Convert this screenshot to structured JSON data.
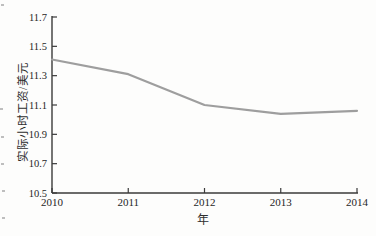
{
  "figure": {
    "background": "#fdfdfc"
  },
  "chart_data": {
    "type": "line",
    "x": [
      2010,
      2011,
      2012,
      2013,
      2014
    ],
    "values": [
      11.41,
      11.31,
      11.1,
      11.04,
      11.06
    ],
    "title": "",
    "xlabel": "年",
    "ylabel": "实际小时工资/美元",
    "xlim": [
      2010,
      2014
    ],
    "ylim": [
      10.5,
      11.7
    ],
    "x_ticks": [
      "2010",
      "2011",
      "2012",
      "2013",
      "2014"
    ],
    "y_ticks": [
      "11.7",
      "11.5",
      "11.3",
      "11.1",
      "10.9",
      "10.7",
      "10.5"
    ],
    "grid": false,
    "legend": "none",
    "line_color": "#9e9e9e",
    "axis_color": "#3a3a3a",
    "tick_label_color": "#262626"
  }
}
